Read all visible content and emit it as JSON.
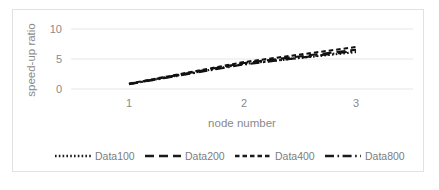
{
  "chart_data": {
    "type": "line",
    "title": "",
    "xlabel": "node number",
    "ylabel": "speed-up ratio",
    "x": [
      1,
      2,
      3
    ],
    "xlim": [
      0.78,
      3.22
    ],
    "ylim": [
      0,
      11.2
    ],
    "xticks": [
      "1",
      "2",
      "3"
    ],
    "yticks": [
      "0",
      "5",
      "10"
    ],
    "ytick_values": [
      0,
      5,
      10
    ],
    "grid": "horizontal",
    "legend_position": "bottom",
    "series": [
      {
        "name": "Data100",
        "values": [
          0.82,
          4.15,
          6.15
        ],
        "style": "dotted"
      },
      {
        "name": "Data200",
        "values": [
          0.85,
          4.3,
          6.55
        ],
        "style": "long-dash"
      },
      {
        "name": "Data400",
        "values": [
          0.88,
          4.45,
          7.0
        ],
        "style": "short-dash"
      },
      {
        "name": "Data800",
        "values": [
          0.8,
          4.05,
          6.35
        ],
        "style": "dash-dot"
      }
    ]
  },
  "legend": {
    "items": [
      {
        "label": "Data100"
      },
      {
        "label": "Data200"
      },
      {
        "label": "Data400"
      },
      {
        "label": "Data800"
      }
    ]
  },
  "axes": {
    "y_title": "speed-up ratio",
    "x_title": "node number",
    "y_tick_0": "0",
    "y_tick_1": "5",
    "y_tick_2": "10",
    "x_tick_0": "1",
    "x_tick_1": "2",
    "x_tick_2": "3"
  },
  "colors": {
    "line": "#111111",
    "grid": "#e6e6e6",
    "text": "#8a8a8a",
    "frame": "#e2e2e2",
    "background": "#ffffff"
  }
}
